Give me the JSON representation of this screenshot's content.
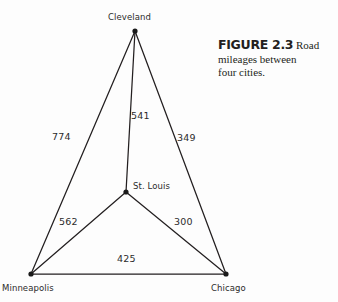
{
  "figure": {
    "caption_number": "FIGURE 2.3",
    "caption_first_word": "Road",
    "caption_line2": "mileages between",
    "caption_line3": "four cities."
  },
  "colors": {
    "background": "#fdfdfd",
    "edge": "#231f20",
    "node": "#1a1a1a",
    "text": "#2b2b2b"
  },
  "chart_data": {
    "type": "diagram",
    "title": "Road mileages between four cities",
    "nodes": [
      {
        "id": "cleveland",
        "label": "Cleveland",
        "x": 135,
        "y": 31
      },
      {
        "id": "stlouis",
        "label": "St. Louis",
        "x": 126,
        "y": 192
      },
      {
        "id": "minneapolis",
        "label": "Minneapolis",
        "x": 31,
        "y": 274
      },
      {
        "id": "chicago",
        "label": "Chicago",
        "x": 226,
        "y": 274
      }
    ],
    "edges": [
      {
        "from": "cleveland",
        "to": "stlouis",
        "label": "541",
        "lx": 131,
        "ly": 110
      },
      {
        "from": "cleveland",
        "to": "minneapolis",
        "label": "774",
        "lx": 52,
        "ly": 131
      },
      {
        "from": "cleveland",
        "to": "chicago",
        "label": "349",
        "lx": 177,
        "ly": 132
      },
      {
        "from": "stlouis",
        "to": "minneapolis",
        "label": "562",
        "lx": 59,
        "ly": 216
      },
      {
        "from": "stlouis",
        "to": "chicago",
        "label": "300",
        "lx": 174,
        "ly": 216
      },
      {
        "from": "minneapolis",
        "to": "chicago",
        "label": "425",
        "lx": 117,
        "ly": 253
      }
    ],
    "node_labels": [
      {
        "id": "cleveland",
        "text": "Cleveland",
        "lx": 108,
        "ly": 12
      },
      {
        "id": "stlouis",
        "text": "St. Louis",
        "lx": 133,
        "ly": 181
      },
      {
        "id": "minneapolis",
        "text": "Minneapolis",
        "lx": 2,
        "ly": 283
      },
      {
        "id": "chicago",
        "text": "Chicago",
        "lx": 211,
        "ly": 283
      }
    ]
  }
}
